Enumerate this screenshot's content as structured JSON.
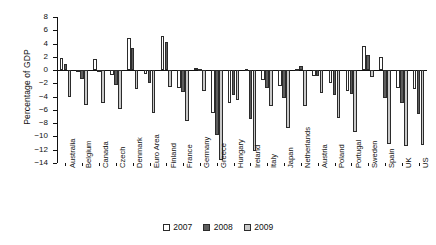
{
  "chart_data": {
    "type": "bar",
    "title": "",
    "xlabel": "",
    "ylabel": "Percentage of GDP",
    "ylim": [
      -14,
      8
    ],
    "ytick_step": 2,
    "yticks": [
      8,
      6,
      4,
      2,
      0,
      -2,
      -4,
      -6,
      -8,
      -10,
      -12,
      -14
    ],
    "ytick_labels": [
      "8",
      "6",
      "4",
      "2",
      "0",
      "−2",
      "−4",
      "−6",
      "−8",
      "−10",
      "−12",
      "−14"
    ],
    "grid": false,
    "legend_position": "bottom-center",
    "orientation": "vertical",
    "categories": [
      "Australia",
      "Belgium",
      "Canada",
      "Czech",
      "Denmark",
      "Euro Area",
      "Finland",
      "France",
      "Germany",
      "Greece",
      "Hungary",
      "Ireland",
      "Italy",
      "Japan",
      "Netherlands",
      "Austria",
      "Poland",
      "Portugal",
      "Sweden",
      "Spain",
      "UK",
      "US"
    ],
    "series": [
      {
        "name": "2007",
        "color": "#ffffff",
        "values": [
          1.8,
          -0.3,
          1.6,
          -0.7,
          4.8,
          -0.6,
          5.2,
          -2.7,
          0.3,
          -6.4,
          -5.0,
          0.1,
          -1.5,
          -2.4,
          0.2,
          -0.9,
          -1.9,
          -3.1,
          3.6,
          1.9,
          -2.7,
          -2.8
        ]
      },
      {
        "name": "2008",
        "color": "#5d5d5d",
        "values": [
          0.9,
          -1.3,
          0.0,
          -2.2,
          3.3,
          -2.0,
          4.2,
          -3.3,
          0.1,
          -9.8,
          -3.7,
          -7.3,
          -2.7,
          -4.2,
          0.6,
          -0.9,
          -3.7,
          -3.6,
          2.2,
          -4.2,
          -5.0,
          -6.6
        ]
      },
      {
        "name": "2009",
        "color": "#c9c9c9",
        "values": [
          -4.0,
          -5.2,
          -4.9,
          -5.9,
          -2.8,
          -6.4,
          -2.5,
          -7.6,
          -3.1,
          -13.6,
          -4.5,
          -12.2,
          -5.4,
          -8.7,
          -5.4,
          -3.5,
          -7.2,
          -9.4,
          -1.0,
          -11.2,
          -11.4,
          -11.3
        ]
      }
    ]
  },
  "legend": {
    "items": [
      {
        "label": "2007",
        "swatch": "legend-swatch-2007"
      },
      {
        "label": "2008",
        "swatch": "legend-swatch-2008"
      },
      {
        "label": "2009",
        "swatch": "legend-swatch-2009"
      }
    ]
  }
}
